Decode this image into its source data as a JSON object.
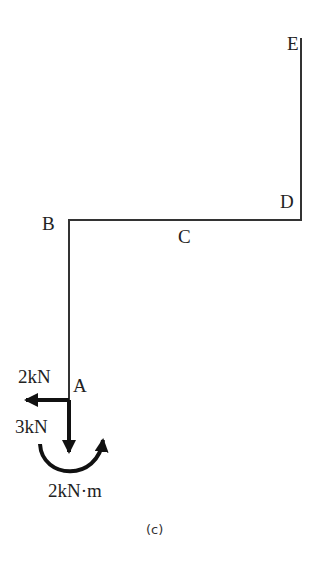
{
  "figure": {
    "caption": "(c)",
    "nodes": {
      "A": "A",
      "B": "B",
      "C": "C",
      "D": "D",
      "E": "E"
    },
    "loads": {
      "horizontal_force": "2kN",
      "vertical_force": "3kN",
      "moment": "2kN·m"
    },
    "colors": {
      "line": "#333333",
      "arrow": "#111111"
    }
  }
}
